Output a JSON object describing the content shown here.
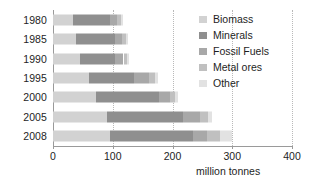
{
  "chart_data": {
    "type": "bar",
    "orientation": "horizontal",
    "stacked": true,
    "title": "",
    "xlabel": "million tonnes",
    "ylabel": "",
    "xlim": [
      0,
      400
    ],
    "xticks": [
      0,
      100,
      200,
      300,
      400
    ],
    "xtick_labels": [
      "0",
      "100",
      "200",
      "300",
      "400"
    ],
    "grid": "vertical-dotted",
    "legend_position": "top-right",
    "categories": [
      "1980",
      "1985",
      "1990",
      "1995",
      "2000",
      "2005",
      "2008"
    ],
    "series": [
      {
        "name": "Biomass",
        "color": "#d2d2d2",
        "values": [
          33,
          38,
          46,
          60,
          72,
          90,
          95
        ]
      },
      {
        "name": "Minerals",
        "color": "#8f8f8f",
        "values": [
          62,
          66,
          58,
          75,
          105,
          128,
          140
        ]
      },
      {
        "name": "Fossil Fuels",
        "color": "#a8a8a8",
        "values": [
          12,
          12,
          14,
          25,
          18,
          28,
          22
        ]
      },
      {
        "name": "Metal ores",
        "color": "#c0c0c0",
        "values": [
          6,
          6,
          6,
          10,
          9,
          14,
          22
        ]
      },
      {
        "name": "Other",
        "color": "#e2e2e2",
        "values": [
          4,
          4,
          4,
          5,
          5,
          6,
          21
        ]
      }
    ],
    "totals": [
      117,
      126,
      128,
      175,
      209,
      266,
      300
    ]
  },
  "axis": {
    "x_title": "million tonnes"
  },
  "legend": {
    "items": [
      {
        "label": "Biomass",
        "swatch": "#d2d2d2"
      },
      {
        "label": "Minerals",
        "swatch": "#8f8f8f"
      },
      {
        "label": "Fossil Fuels",
        "swatch": "#a8a8a8"
      },
      {
        "label": "Metal ores",
        "swatch": "#c0c0c0"
      },
      {
        "label": "Other",
        "swatch": "#e2e2e2"
      }
    ]
  },
  "colors": {
    "axis": "#9a9a9a",
    "grid": "#b9b9b9",
    "text": "#1e1e1e",
    "background": "#ffffff"
  }
}
